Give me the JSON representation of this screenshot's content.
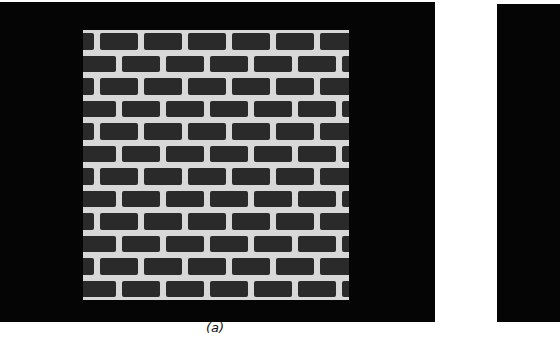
{
  "figure": {
    "panels": [
      {
        "id": "a",
        "caption": "(a)",
        "content": "brick wall texture",
        "brick_rows": 12,
        "bricks_per_row": 6
      },
      {
        "id": "b",
        "caption": "",
        "content": "partially visible dark panel (cropped)"
      }
    ],
    "colors": {
      "background": "#ffffff",
      "panel": "#050505",
      "mortar": "#d8d8d8",
      "brick": "#2a2a2a"
    }
  }
}
